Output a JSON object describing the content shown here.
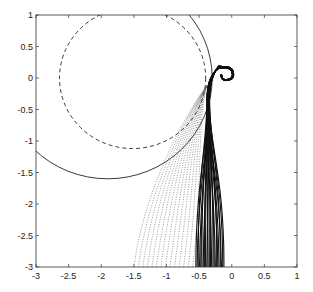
{
  "chart_data": {
    "type": "line",
    "title": "",
    "xlabel": "",
    "ylabel": "",
    "xlim": [
      -3,
      1
    ],
    "ylim": [
      -3,
      1
    ],
    "grid": false,
    "legend": null,
    "xticks": [
      -3,
      -2.5,
      -2,
      -1.5,
      -1,
      -0.5,
      0,
      0.5,
      1
    ],
    "yticks": [
      -3,
      -2.5,
      -2,
      -1.5,
      -1,
      -0.5,
      0,
      0.5,
      1
    ],
    "xtick_labels": [
      "-3",
      "-2.5",
      "-2",
      "-1.5",
      "-1",
      "-0.5",
      "0",
      "0.5",
      "1"
    ],
    "ytick_labels": [
      "-3",
      "-2.5",
      "-2",
      "-1.5",
      "-1",
      "-0.5",
      "0",
      "0.5",
      "1"
    ],
    "series": [
      {
        "name": "dashed-circle",
        "style": "dashed",
        "shape": "circle",
        "center": [
          -1.52,
          0.0
        ],
        "radius": 1.12
      },
      {
        "name": "solid-circle",
        "style": "solid",
        "shape": "circle",
        "center": [
          -1.9,
          0.0
        ],
        "radius": 1.6
      },
      {
        "name": "solid-trajectories",
        "style": "solid",
        "description": "dense bundle of solid trajectories rising from y=-3 between x≈-0.55 and x≈-0.12, converging near (-0.35, -0.1) and curling into a spiral centred near (-0.1, 0.05)",
        "count": 24,
        "x_start_range": [
          -0.55,
          -0.12
        ],
        "spiral_center": [
          -0.1,
          0.05
        ]
      },
      {
        "name": "dotted-trajectories",
        "style": "dotted",
        "description": "fan of dotted trajectories rising from y=-3 between x≈-1.5 and x≈-0.6 and converging toward (-0.4, -0.1)",
        "count": 14,
        "x_start_range": [
          -1.5,
          -0.6
        ]
      }
    ]
  }
}
